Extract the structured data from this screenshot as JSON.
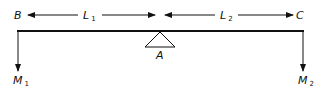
{
  "diagram": {
    "type": "lever-beam",
    "points": {
      "left_end": "B",
      "right_end": "C",
      "fulcrum": "A"
    },
    "dimensions": {
      "left_length": {
        "symbol": "L",
        "subscript": "1"
      },
      "right_length": {
        "symbol": "L",
        "subscript": "2"
      }
    },
    "loads": {
      "left_mass": {
        "symbol": "M",
        "subscript": "1"
      },
      "right_mass": {
        "symbol": "M",
        "subscript": "2"
      }
    },
    "colors": {
      "line": "#111111",
      "background": "#ffffff"
    }
  }
}
